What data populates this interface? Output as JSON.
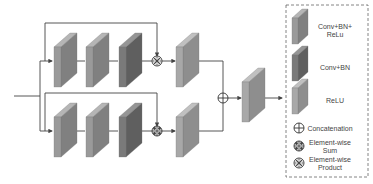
{
  "diagram": {
    "colors": {
      "conv_bn_relu": {
        "front": "#9a9a9a",
        "side": "#808080",
        "top": "#b5b5b5"
      },
      "conv_bn": {
        "front": "#7a7a7a",
        "side": "#5f5f5f",
        "top": "#959595"
      },
      "relu": {
        "front": "#a8a8a8",
        "side": "#8e8e8e",
        "top": "#c0c0c0"
      },
      "line": "#444444",
      "legend_border": "#666666"
    },
    "branches": [
      {
        "name": "top",
        "blocks": [
          "conv_bn_relu",
          "conv_bn_relu",
          "conv_bn"
        ],
        "merge_op": "element-wise-product",
        "post_block": "relu"
      },
      {
        "name": "bottom",
        "blocks": [
          "conv_bn_relu",
          "conv_bn_relu",
          "conv_bn"
        ],
        "merge_op": "element-wise-sum",
        "post_block": "relu"
      }
    ],
    "fusion_op": "concatenation",
    "output_block": "relu"
  },
  "legend": {
    "items": [
      {
        "key": "conv_bn_relu",
        "type": "block",
        "label_lines": [
          "Conv+BN+",
          "ReLu"
        ]
      },
      {
        "key": "conv_bn",
        "type": "block",
        "label_lines": [
          "Conv+BN"
        ]
      },
      {
        "key": "relu",
        "type": "block",
        "label_lines": [
          "ReLU"
        ]
      },
      {
        "key": "concatenation",
        "type": "symbol",
        "icon": "circle-plus-icon",
        "label_lines": [
          "Concatenation"
        ]
      },
      {
        "key": "element-wise-sum",
        "type": "symbol",
        "icon": "circle-cross-dots-icon",
        "label_lines": [
          "Element-wise",
          "Sum"
        ]
      },
      {
        "key": "element-wise-product",
        "type": "symbol",
        "icon": "circle-x-icon",
        "label_lines": [
          "Element-wise",
          "Product"
        ]
      }
    ]
  }
}
